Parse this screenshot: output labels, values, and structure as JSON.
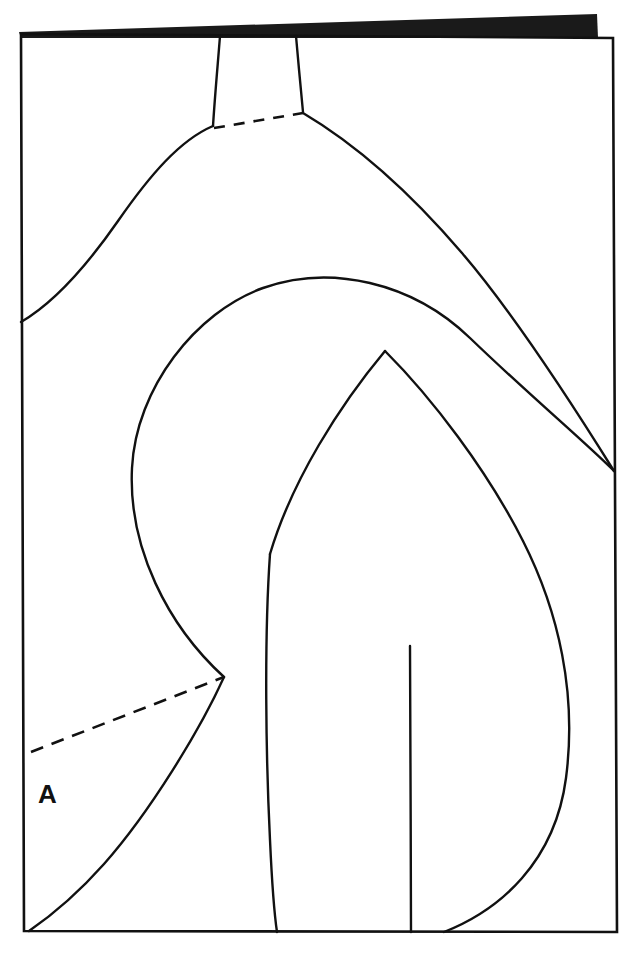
{
  "figure": {
    "kind": "technical-line-diagram",
    "caption_visible": false,
    "background_color": "#ffffff",
    "ink_color": "#111111",
    "band_color": "#1a1a1a",
    "labels": [
      {
        "id": "label-a",
        "text": "A",
        "x": 38,
        "y": 803
      }
    ],
    "frame": {
      "name": "outer-frame",
      "top_left": [
        21,
        34
      ],
      "top_right": [
        613,
        38
      ],
      "bottom_right": [
        617,
        932
      ],
      "bottom_left": [
        24,
        931
      ],
      "stroke_width": 2.6
    },
    "top_band": {
      "name": "top-black-band",
      "points": "19,32 597,14 598,38 21,38",
      "fill": "#1a1a1a"
    },
    "strokes": {
      "neck_left": "M 220,36 C 218,62 215,94 213,126",
      "neck_right": "M 296,36 C 298,60 301,90 303,112",
      "dashed_neck": "M 214,128 L 303,113",
      "outer_left_shoulder": "M 213,126 C 180,140 150,175 118,221 C 86,267 52,304 21,322",
      "outer_right_shoulder": "M 303,113 C 352,142 408,190 462,253 C 516,316 576,410 614,471",
      "inner_arc": "M 224,677 C 168,626 128,548 132,468 C 136,388 196,312 263,288 C 330,264 412,282 470,338 C 528,394 584,441 614,471",
      "inner_peak_left": "M 270,554 C 292,480 340,405 385,351",
      "inner_peak_right": "M 385,351 C 432,398 487,470 523,541 C 559,612 577,694 566,778 C 555,862 500,910 444,932",
      "torso_left": "M 270,554 C 264,640 266,760 270,840 C 272,884 274,912 277,932",
      "lower_left_curve": "M 224,677 C 200,730 150,812 104,864 C 72,900 45,920 29,931",
      "center_vertical": "M 410,646 C 410,720 411,840 411,932"
    },
    "dashes": {
      "neck_dash_pattern": "11 9",
      "lower_dash_pattern": "13 9",
      "lower_dashed_line": "M 31,752 L 224,677"
    }
  }
}
